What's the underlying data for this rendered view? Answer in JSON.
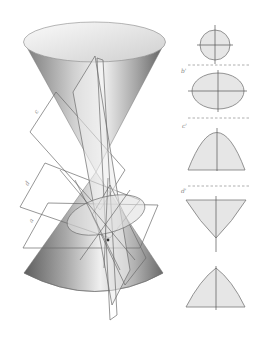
{
  "colors": {
    "background": "#ffffff",
    "cone_dark": "#6e6e6e",
    "cone_light": "#f2f2f2",
    "section_fill": "#e6e6e6",
    "line": "#6a6a6a"
  },
  "left_figure": {
    "description": "Double right circular cone intersected by cutting planes",
    "plane_labels": [
      "c",
      "d",
      "a"
    ]
  },
  "right_figure": {
    "sections": [
      {
        "label": "",
        "shape": "circle"
      },
      {
        "label": "b'",
        "shape": "ellipse"
      },
      {
        "label": "c'",
        "shape": "parabola"
      },
      {
        "label": "d'",
        "shape": "hyperbola (upper branch)"
      },
      {
        "label": "",
        "shape": "hyperbola (lower branch)"
      }
    ]
  }
}
